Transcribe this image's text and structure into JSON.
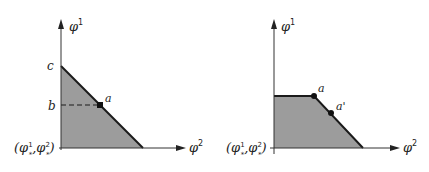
{
  "colors": {
    "fill": "#9c9c9c",
    "line": "#1a1a1a",
    "background": "#ffffff"
  },
  "left_diagram": {
    "y_axis_label": "φ",
    "y_axis_sup": "1",
    "x_axis_label": "φ",
    "x_axis_sup": "2",
    "origin_label_open": "(φ",
    "origin_sup1": "1",
    "origin_sub1": "*",
    "origin_sep": ",φ",
    "origin_sup2": "2",
    "origin_sub2": "*",
    "origin_label_close": ")",
    "tick_c": "c",
    "tick_b": "b",
    "point_a": "a"
  },
  "right_diagram": {
    "y_axis_label": "φ",
    "y_axis_sup": "1",
    "x_axis_label": "φ",
    "x_axis_sup": "2",
    "origin_label_open": "(φ",
    "origin_sup1": "1",
    "origin_sub1": "*",
    "origin_sep": ",φ",
    "origin_sup2": "2",
    "origin_sub2": "*",
    "origin_label_close": ")",
    "point_a": "a",
    "point_a_prime": "a'"
  }
}
